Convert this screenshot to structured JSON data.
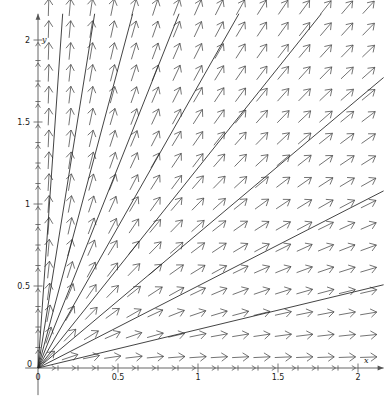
{
  "figure": {
    "title": "",
    "width": 390,
    "height": 404,
    "background_color": "#ffffff"
  },
  "chart_data": {
    "type": "scatter",
    "subtype": "direction-field-with-solution-curves",
    "title": "",
    "xlabel": "x",
    "ylabel": "y",
    "xlim": [
      -0.08,
      2.16
    ],
    "ylim": [
      -0.08,
      2.16
    ],
    "grid": false,
    "legend": null,
    "axis_color": "#555555",
    "arrow_color": "#444444",
    "curve_color": "#222222",
    "x_ticks": [
      0,
      0.125,
      0.25,
      0.375,
      0.5,
      0.625,
      0.75,
      0.875,
      1,
      1.125,
      1.25,
      1.375,
      1.5,
      1.625,
      1.75,
      1.875,
      2
    ],
    "y_ticks": [
      0,
      0.125,
      0.25,
      0.375,
      0.5,
      0.625,
      0.75,
      0.875,
      1,
      1.125,
      1.25,
      1.375,
      1.5,
      1.625,
      1.75,
      1.875,
      2
    ],
    "x_tick_labels": [
      {
        "value": 0,
        "text": "0"
      },
      {
        "value": 0.5,
        "text": "0.5"
      },
      {
        "value": 1,
        "text": "1"
      },
      {
        "value": 1.5,
        "text": "1.5"
      },
      {
        "value": 2,
        "text": "2"
      }
    ],
    "y_tick_labels": [
      {
        "value": 0,
        "text": "0"
      },
      {
        "value": 0.5,
        "text": "0.5"
      },
      {
        "value": 1,
        "text": "1"
      },
      {
        "value": 1.5,
        "text": "1.5"
      },
      {
        "value": 2,
        "text": "2"
      }
    ],
    "field": {
      "equation_text": "dy/dx = y/x",
      "description": "unit vectors pointing radially away from the origin",
      "grid_x_start": 0.066,
      "grid_x_step": 0.1333,
      "grid_x_count": 16,
      "grid_y_start": 0.066,
      "grid_y_step": 0.1333,
      "grid_y_count": 17,
      "arrow_length": 0.105,
      "arrow_head_length": 0.038,
      "arrow_head_width": 0.026
    },
    "solution_curves": {
      "description": "straight rays y = m x through the origin",
      "slopes": [
        0.235,
        0.5,
        0.82,
        1.22,
        1.72,
        2.45,
        3.65,
        6.1,
        14.0
      ]
    }
  },
  "axes_labels": {
    "x_axis_name": "x",
    "y_axis_name": "y"
  }
}
